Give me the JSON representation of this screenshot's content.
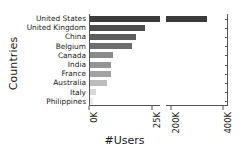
{
  "chart_data": {
    "type": "bar",
    "orientation": "horizontal",
    "title": "",
    "xlabel": "#Users",
    "ylabel": "Countries",
    "grid": false,
    "legend": null,
    "broken_axis": true,
    "categories": [
      "United States",
      "United Kingdom",
      "China",
      "Belgium",
      "Canada",
      "India",
      "France",
      "Australia",
      "Italy",
      "Philippines"
    ],
    "values": [
      340000,
      22000,
      18500,
      17000,
      9500,
      8800,
      8500,
      7200,
      2600,
      1500
    ],
    "bar_colors": [
      "#3b3b3b",
      "#4e4e4e",
      "#5e5e5e",
      "#6d6d6d",
      "#8a8a8a",
      "#959595",
      "#a3a3a3",
      "#bcbcbc",
      "#d8d8d8",
      "#ebebeb"
    ],
    "panels": [
      {
        "name": "left",
        "xlim": [
          0,
          28000
        ],
        "ticks": [
          0,
          25000
        ],
        "ticklabels": [
          "0K",
          "25K"
        ]
      },
      {
        "name": "right",
        "xlim": [
          180000,
          420000
        ],
        "ticks": [
          200000,
          400000
        ],
        "ticklabels": [
          "200K",
          "400K"
        ]
      }
    ]
  },
  "axes": {
    "ylabel": "Countries",
    "xlabel": "#Users"
  }
}
